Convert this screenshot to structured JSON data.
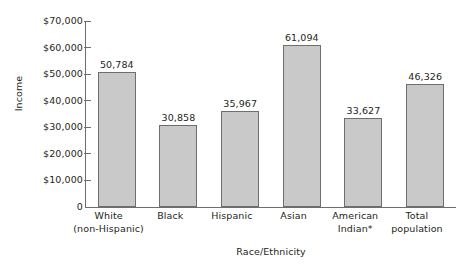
{
  "chart_data": {
    "type": "bar",
    "title": "",
    "xlabel": "Race/Ethnicity",
    "ylabel": "Income",
    "categories": [
      "White (non-Hispanic)",
      "Black",
      "Hispanic",
      "Asian",
      "American Indian*",
      "Total population"
    ],
    "category_lines": [
      [
        "White",
        "(non-Hispanic)"
      ],
      [
        "Black",
        ""
      ],
      [
        "Hispanic",
        ""
      ],
      [
        "Asian",
        ""
      ],
      [
        "American",
        "Indian*"
      ],
      [
        "Total",
        "population"
      ]
    ],
    "values": [
      50784,
      30858,
      35967,
      61094,
      33627,
      46326
    ],
    "value_labels": [
      "50,784",
      "30,858",
      "35,967",
      "61,094",
      "33,627",
      "46,326"
    ],
    "ylim": [
      0,
      70000
    ],
    "ytick_values": [
      0,
      10000,
      20000,
      30000,
      40000,
      50000,
      60000,
      70000
    ],
    "ytick_labels": [
      "0",
      "$10,000",
      "$20,000",
      "$30,000",
      "$40,000",
      "$50,000",
      "$60,000",
      "$70,000"
    ],
    "grid": false,
    "legend": "none",
    "bar_color": "#c9c9c9",
    "bar_border_color": "#6d6e71",
    "axis_color": "#6d6e71",
    "text_color": "#231f20"
  }
}
